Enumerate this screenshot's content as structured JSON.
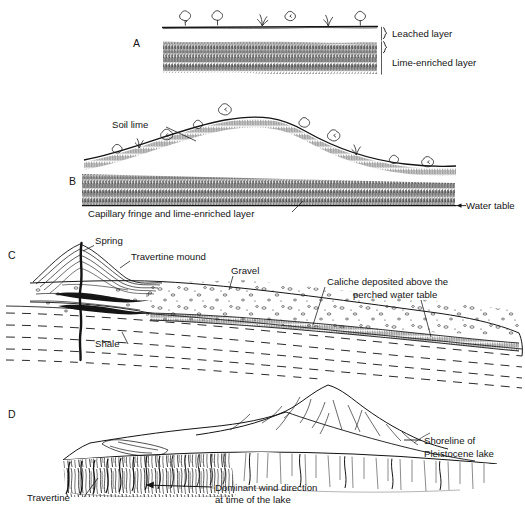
{
  "figure": {
    "type": "geological-cross-section-diagram",
    "panel_count": 4,
    "background_color": "#ffffff",
    "ink_color": "#141414",
    "caption_partial": "",
    "panels": [
      {
        "letter": "A",
        "name": "flat-terrain-soil-profile",
        "labels": [
          {
            "text": "Leached layer",
            "name": "leached-layer-label"
          },
          {
            "text": "Lime-enriched layer",
            "name": "lime-enriched-layer-label"
          }
        ],
        "features": [
          "ground-surface-line",
          "shrubs",
          "grass-tufts",
          "brace-markers",
          "hatched-lime-band"
        ]
      },
      {
        "letter": "B",
        "name": "hill-soil-profile-with-water-table",
        "labels": [
          {
            "text": "Soil lime",
            "name": "soil-lime-label"
          },
          {
            "text": "Capillary fringe and lime-enriched layer",
            "name": "capillary-fringe-label"
          },
          {
            "text": "Water table",
            "name": "water-table-label"
          }
        ],
        "features": [
          "hill-surface-curve",
          "shrubs",
          "grass-tufts",
          "soil-lime-band",
          "capillary-fringe-band",
          "water-table-arrow"
        ]
      },
      {
        "letter": "C",
        "name": "spring-travertine-mound-section",
        "labels": [
          {
            "text": "Spring",
            "name": "spring-label"
          },
          {
            "text": "Travertine mound",
            "name": "travertine-mound-label"
          },
          {
            "text": "Gravel",
            "name": "gravel-label"
          },
          {
            "text": "Caliche deposited above the",
            "name": "caliche-label-line1"
          },
          {
            "text": "perched  water table",
            "name": "caliche-label-line2"
          },
          {
            "text": "Shale",
            "name": "shale-label"
          }
        ],
        "features": [
          "spring-conduit",
          "travertine-beds",
          "gravel-pebbles",
          "caliche-hatched-band",
          "shale-dashed-bedding"
        ]
      },
      {
        "letter": "D",
        "name": "pleistocene-lake-shoreline-travertine",
        "labels": [
          {
            "text": "Shoreline of",
            "name": "shoreline-label-line1"
          },
          {
            "text": "Pleistocene lake",
            "name": "shoreline-label-line2"
          },
          {
            "text": "Dominant wind direction",
            "name": "wind-direction-label-line1"
          },
          {
            "text": "at time of  the lake",
            "name": "wind-direction-label-line2"
          },
          {
            "text": "Travertine",
            "name": "travertine-label"
          }
        ],
        "features": [
          "butte-hill",
          "terrace-surface",
          "travertine-drape",
          "wind-arrow",
          "shoreline-leader"
        ]
      }
    ]
  }
}
